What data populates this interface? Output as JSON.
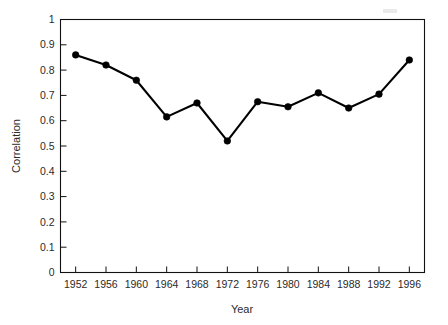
{
  "chart_data": {
    "type": "line",
    "title": "",
    "subtitle": "",
    "xlabel": "Year",
    "ylabel": "Correlation",
    "x": [
      1952,
      1956,
      1960,
      1964,
      1968,
      1972,
      1976,
      1980,
      1984,
      1988,
      1992,
      1996
    ],
    "values": [
      0.86,
      0.82,
      0.76,
      0.615,
      0.67,
      0.52,
      0.675,
      0.655,
      0.71,
      0.65,
      0.705,
      0.84
    ],
    "series": [
      {
        "name": "Correlation",
        "values": [
          0.86,
          0.82,
          0.76,
          0.615,
          0.67,
          0.52,
          0.675,
          0.655,
          0.71,
          0.65,
          0.705,
          0.84
        ]
      }
    ],
    "categories": [
      "1952",
      "1956",
      "1960",
      "1964",
      "1968",
      "1972",
      "1976",
      "1980",
      "1984",
      "1988",
      "1992",
      "1996"
    ],
    "xlim": [
      1950,
      1998
    ],
    "ylim": [
      0,
      1
    ],
    "xticks": [
      1952,
      1956,
      1960,
      1964,
      1968,
      1972,
      1976,
      1980,
      1984,
      1988,
      1992,
      1996
    ],
    "xtick_labels": [
      "1952",
      "1956",
      "1960",
      "1964",
      "1968",
      "1972",
      "1976",
      "1980",
      "1984",
      "1988",
      "1992",
      "1996"
    ],
    "yticks": [
      0,
      0.1,
      0.2,
      0.3,
      0.4,
      0.5,
      0.6,
      0.7,
      0.8,
      0.9,
      1
    ],
    "ytick_labels": [
      "0",
      "0.1",
      "0.2",
      "0.3",
      "0.4",
      "0.5",
      "0.6",
      "0.7",
      "0.8",
      "0.9",
      "1"
    ],
    "grid": false,
    "legend": null,
    "legend_position": "none",
    "marker": "filled-circle",
    "line_color": "#000000",
    "marker_color": "#000000",
    "background_color": "#ffffff",
    "frame_color": "#111111",
    "annotations": []
  },
  "figure": {
    "width": 448,
    "height": 325
  }
}
